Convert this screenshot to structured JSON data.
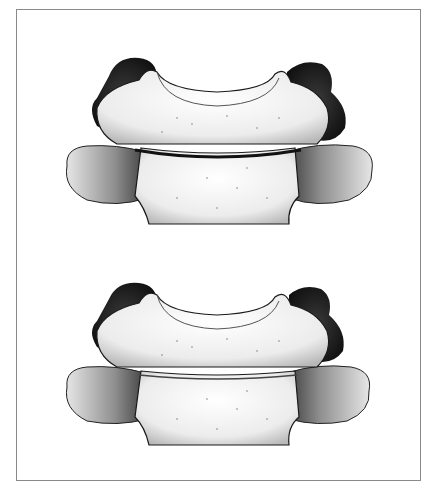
{
  "figure": {
    "type": "stippled anatomical illustration",
    "views": [
      {
        "id": "upper",
        "label": ""
      },
      {
        "id": "lower",
        "label": ""
      }
    ],
    "colors": {
      "frame_border": "#8a8a8a",
      "background": "#ffffff",
      "ink_dark": "#1a1a1a",
      "ink_mid": "#6b6b6b",
      "bone_light": "#f2f2f2"
    }
  }
}
